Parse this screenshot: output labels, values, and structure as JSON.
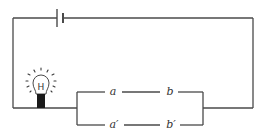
{
  "diagram": {
    "type": "electric-circuit",
    "components": {
      "battery": {
        "name": "battery",
        "position": "top wire"
      },
      "bulb": {
        "name": "light-bulb",
        "state": "lit",
        "filament_glyph": "H"
      },
      "parallel_branches": [
        {
          "name": "top-branch",
          "labels": [
            "a",
            "b"
          ]
        },
        {
          "name": "bottom-branch",
          "labels": [
            "a′",
            "b′"
          ]
        }
      ]
    },
    "labels": {
      "a": "a",
      "b": "b",
      "a_prime": "a′",
      "b_prime": "b′",
      "filament": "H"
    },
    "colors": {
      "wire": "#4a4a4a",
      "bulb_base": "#1a1a1a",
      "background": "#ffffff"
    }
  }
}
